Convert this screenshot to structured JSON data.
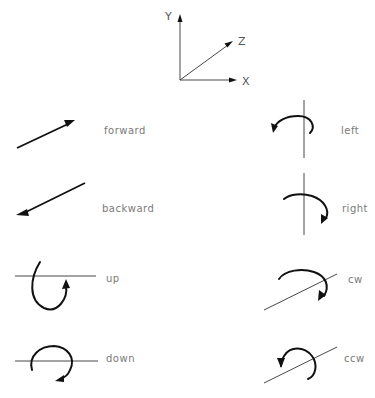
{
  "axes": {
    "x_label": "X",
    "y_label": "Y",
    "z_label": "Z"
  },
  "motions": {
    "forward": "forward",
    "backward": "backward",
    "up": "up",
    "down": "down",
    "left": "left",
    "right": "right",
    "cw": "cw",
    "ccw": "ccw"
  },
  "colors": {
    "stroke": "#111111",
    "label": "#7a7a7a"
  }
}
